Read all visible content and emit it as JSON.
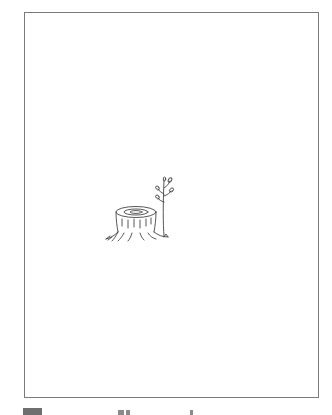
{
  "page": {
    "frame": {
      "border_color": "#7a7a7a",
      "background": "#ffffff"
    },
    "illustration": {
      "subject": "tree-stump-with-sprout",
      "stroke_color": "#444444"
    },
    "footer": {
      "caption": ""
    }
  }
}
